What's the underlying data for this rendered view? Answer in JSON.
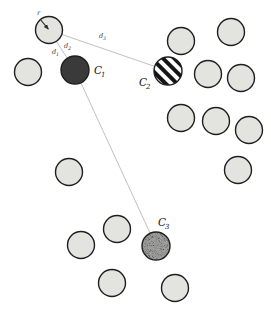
{
  "figure": {
    "background_color": "#ffffff",
    "width": 271,
    "height": 315,
    "plain_fill": "#e3e3e0",
    "plain_stroke": "#1f1f1f",
    "dark_fill": "#3a3a3a",
    "stripe_fill": "#ffffff",
    "stripe_color": "#151515",
    "speckle_base": "#9a9a98",
    "line_color": "#b9b9b9"
  },
  "labels": {
    "c1": "C₁",
    "c2": "C₂",
    "c3": "C₃",
    "radius": "r",
    "d1": "d₁",
    "d2": "d₂",
    "d3": "d₃"
  },
  "chart_data": {
    "type": "scatter",
    "title": "",
    "xlabel": "",
    "ylabel": "",
    "xlim": [
      0,
      271
    ],
    "ylim": [
      0,
      315
    ],
    "grid": false,
    "legend": "none",
    "marker_shape": "circle",
    "marker_radius": 13.5,
    "series": [
      {
        "name": "plain-particles",
        "style": "light-gray-fill",
        "fill": "#e3e3e0",
        "stroke": "#1f1f1f",
        "points": [
          {
            "id": "p1",
            "x": 49,
            "y": 30
          },
          {
            "id": "p2",
            "x": 28,
            "y": 72
          },
          {
            "id": "p3",
            "x": 181,
            "y": 41
          },
          {
            "id": "p4",
            "x": 231,
            "y": 32
          },
          {
            "id": "p5",
            "x": 208,
            "y": 74
          },
          {
            "id": "p6",
            "x": 241,
            "y": 78
          },
          {
            "id": "p7",
            "x": 181,
            "y": 118
          },
          {
            "id": "p8",
            "x": 216,
            "y": 121
          },
          {
            "id": "p9",
            "x": 249,
            "y": 130
          },
          {
            "id": "p10",
            "x": 238,
            "y": 170
          },
          {
            "id": "p11",
            "x": 69,
            "y": 172
          },
          {
            "id": "p12",
            "x": 117,
            "y": 229
          },
          {
            "id": "p13",
            "x": 81,
            "y": 245
          },
          {
            "id": "p14",
            "x": 112,
            "y": 283
          },
          {
            "id": "p15",
            "x": 175,
            "y": 288
          }
        ]
      },
      {
        "name": "marked-particles",
        "style": "highlighted",
        "points": [
          {
            "id": "C1",
            "x": 75,
            "y": 70,
            "label": "C₁",
            "pattern": "solid-dark"
          },
          {
            "id": "C2",
            "x": 168,
            "y": 71,
            "label": "C₂",
            "pattern": "diagonal-stripes"
          },
          {
            "id": "C3",
            "x": 156,
            "y": 246,
            "label": "C₃",
            "pattern": "speckled"
          }
        ]
      }
    ],
    "connectors": [
      {
        "id": "d2-line",
        "from": "p1",
        "to": "C2",
        "label": "d₂"
      },
      {
        "id": "d1-line",
        "from": "p1",
        "to": "C1",
        "label": "d₁"
      },
      {
        "id": "d3-line",
        "from": "C1",
        "to": "C3",
        "label": "d₃"
      }
    ],
    "annotations": [
      {
        "id": "radius-arrow",
        "target": "p1",
        "label": "r",
        "type": "radius-indicator"
      }
    ]
  }
}
